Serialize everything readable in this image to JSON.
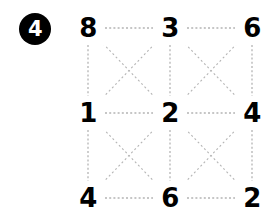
{
  "figure": {
    "badge": {
      "label": "4",
      "background_color": "#000000",
      "text_color": "#ffffff"
    },
    "grid": {
      "rows": 3,
      "cols": 3,
      "node_color": "#000000",
      "edge_color": "#b4b4b4",
      "edge_style": "dashed",
      "background_color": "#ffffff"
    },
    "nodes": [
      {
        "id": "r0c0",
        "row": 0,
        "col": 0,
        "label": "8",
        "x": 88,
        "y": 28
      },
      {
        "id": "r0c1",
        "row": 0,
        "col": 1,
        "label": "3",
        "x": 170,
        "y": 28
      },
      {
        "id": "r0c2",
        "row": 0,
        "col": 2,
        "label": "6",
        "x": 252,
        "y": 28
      },
      {
        "id": "r1c0",
        "row": 1,
        "col": 0,
        "label": "1",
        "x": 88,
        "y": 113
      },
      {
        "id": "r1c1",
        "row": 1,
        "col": 1,
        "label": "2",
        "x": 170,
        "y": 113
      },
      {
        "id": "r1c2",
        "row": 1,
        "col": 2,
        "label": "4",
        "x": 252,
        "y": 113
      },
      {
        "id": "r2c0",
        "row": 2,
        "col": 0,
        "label": "4",
        "x": 88,
        "y": 198
      },
      {
        "id": "r2c1",
        "row": 2,
        "col": 1,
        "label": "6",
        "x": 170,
        "y": 198
      },
      {
        "id": "r2c2",
        "row": 2,
        "col": 2,
        "label": "2",
        "x": 252,
        "y": 198
      }
    ],
    "edges": [
      {
        "from": "r0c0",
        "to": "r0c1",
        "kind": "horizontal"
      },
      {
        "from": "r0c1",
        "to": "r0c2",
        "kind": "horizontal"
      },
      {
        "from": "r1c0",
        "to": "r1c1",
        "kind": "horizontal"
      },
      {
        "from": "r1c1",
        "to": "r1c2",
        "kind": "horizontal"
      },
      {
        "from": "r2c0",
        "to": "r2c1",
        "kind": "horizontal"
      },
      {
        "from": "r2c1",
        "to": "r2c2",
        "kind": "horizontal"
      },
      {
        "from": "r0c0",
        "to": "r1c0",
        "kind": "vertical"
      },
      {
        "from": "r1c0",
        "to": "r2c0",
        "kind": "vertical"
      },
      {
        "from": "r0c1",
        "to": "r1c1",
        "kind": "vertical"
      },
      {
        "from": "r1c1",
        "to": "r2c1",
        "kind": "vertical"
      },
      {
        "from": "r0c2",
        "to": "r1c2",
        "kind": "vertical"
      },
      {
        "from": "r1c2",
        "to": "r2c2",
        "kind": "vertical"
      },
      {
        "from": "r0c0",
        "to": "r1c1",
        "kind": "diagonal"
      },
      {
        "from": "r0c1",
        "to": "r1c0",
        "kind": "diagonal"
      },
      {
        "from": "r0c1",
        "to": "r1c2",
        "kind": "diagonal"
      },
      {
        "from": "r0c2",
        "to": "r1c1",
        "kind": "diagonal"
      },
      {
        "from": "r1c0",
        "to": "r2c1",
        "kind": "diagonal"
      },
      {
        "from": "r1c1",
        "to": "r2c0",
        "kind": "diagonal"
      },
      {
        "from": "r1c1",
        "to": "r2c2",
        "kind": "diagonal"
      },
      {
        "from": "r1c2",
        "to": "r2c1",
        "kind": "diagonal"
      }
    ]
  }
}
